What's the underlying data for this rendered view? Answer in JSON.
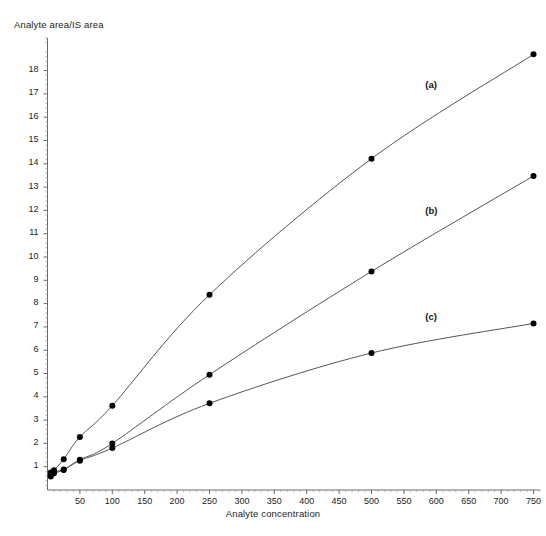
{
  "chart_data": {
    "type": "line",
    "title": "",
    "subtitle": "",
    "xlabel": "Analyte concentration",
    "ylabel": "Analyte area/IS area",
    "xlim": [
      0,
      760
    ],
    "ylim": [
      0,
      19.4
    ],
    "xticks": [
      50,
      100,
      150,
      200,
      250,
      300,
      350,
      400,
      450,
      500,
      550,
      600,
      650,
      700,
      750
    ],
    "yticks": [
      1,
      2,
      3,
      4,
      5,
      6,
      7,
      8,
      9,
      10,
      11,
      12,
      13,
      14,
      15,
      16,
      17,
      18
    ],
    "xtick_labels": [
      "50",
      "100",
      "150",
      "200",
      "250",
      "300",
      "350",
      "400",
      "450",
      "500",
      "550",
      "600",
      "650",
      "700",
      "750"
    ],
    "ytick_labels": [
      "1",
      "2",
      "3",
      "4",
      "5",
      "6",
      "7",
      "8",
      "9",
      "10",
      "11",
      "12",
      "13",
      "14",
      "15",
      "16",
      "17",
      "18"
    ],
    "minor_ticks": true,
    "grid": false,
    "legend_position": "inline-annotations",
    "marker": "filled-circle",
    "marker_color": "#000000",
    "line_color": "#555555",
    "x": [
      5,
      10,
      25,
      50,
      100,
      250,
      500,
      750
    ],
    "series": [
      {
        "name": "(a)",
        "label": "(a)",
        "values": [
          0.75,
          0.85,
          1.32,
          2.28,
          3.62,
          8.38,
          14.22,
          18.7
        ],
        "annotation": "(a)"
      },
      {
        "name": "(b)",
        "label": "(b)",
        "values": [
          0.62,
          0.78,
          0.88,
          1.3,
          2.0,
          4.95,
          9.38,
          13.48
        ],
        "annotation": "(b)"
      },
      {
        "name": "(c)",
        "label": "(c)",
        "values": [
          0.58,
          0.72,
          0.86,
          1.26,
          1.8,
          3.72,
          5.88,
          7.15
        ],
        "annotation": "(c)"
      }
    ],
    "annotations": [
      {
        "text": "(a)",
        "x": 597,
        "y": 17.35
      },
      {
        "text": "(b)",
        "x": 597,
        "y": 11.95
      },
      {
        "text": "(c)",
        "x": 597,
        "y": 7.4
      }
    ]
  }
}
